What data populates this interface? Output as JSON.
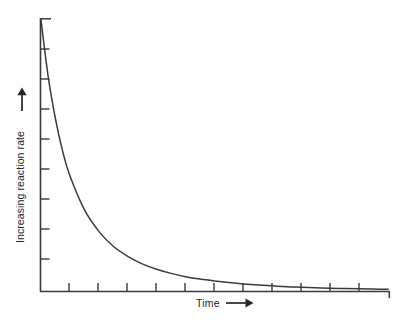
{
  "figure": {
    "background_color": "#ffffff",
    "ink_color": "#3a3a3a",
    "text_color": "#262626"
  },
  "axes": {
    "y": {
      "label": "Increasing reaction rate",
      "arrow_icon": "up-arrow-icon",
      "tick_count": 9,
      "tick_direction": "right",
      "has_top_cap": true
    },
    "x": {
      "label": "Time",
      "arrow_icon": "right-arrow-icon",
      "tick_count": 12,
      "tick_direction": "up",
      "has_end_cap": true
    }
  },
  "chart_data": {
    "type": "line",
    "title": "",
    "xlabel": "Time",
    "ylabel": "Increasing reaction rate",
    "grid": false,
    "legend": false,
    "axis_tick_labels": {
      "x": [],
      "y": []
    },
    "xlim": [
      0,
      12
    ],
    "ylim": [
      0,
      10
    ],
    "series": [
      {
        "name": "reaction rate",
        "curve": "exponential-decay",
        "x": [
          0.0,
          0.25,
          0.5,
          0.75,
          1.0,
          1.5,
          2.0,
          2.5,
          3.0,
          3.5,
          4.0,
          4.5,
          5.0,
          5.5,
          6.0,
          6.5,
          7.0,
          7.5,
          8.0,
          8.5,
          9.0,
          9.5,
          10.0,
          10.5,
          11.0,
          11.5,
          12.0
        ],
        "y": [
          10.0,
          7.9,
          6.35,
          5.15,
          4.25,
          3.0,
          2.2,
          1.65,
          1.28,
          1.0,
          0.8,
          0.65,
          0.53,
          0.44,
          0.37,
          0.31,
          0.26,
          0.22,
          0.19,
          0.16,
          0.14,
          0.12,
          0.1,
          0.09,
          0.08,
          0.07,
          0.06
        ]
      }
    ]
  }
}
